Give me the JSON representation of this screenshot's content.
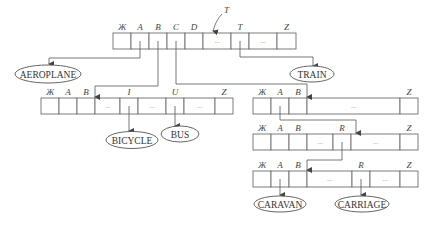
{
  "diagram": {
    "pointer_label": "T",
    "nodes": [
      {
        "id": "root",
        "cells": [
          "Ж",
          "A",
          "B",
          "C",
          "D",
          "...",
          "T",
          "...",
          "Z"
        ]
      },
      {
        "id": "node-b",
        "cells": [
          "Ж",
          "A",
          "B",
          "...",
          "I",
          "...",
          "U",
          "...",
          "Z"
        ]
      },
      {
        "id": "node-c",
        "cells": [
          "Ж",
          "A",
          "B",
          "...",
          "Z"
        ]
      },
      {
        "id": "node-ca",
        "cells": [
          "Ж",
          "A",
          "B",
          "...",
          "R",
          "...",
          "Z"
        ]
      },
      {
        "id": "node-car",
        "cells": [
          "Ж",
          "A",
          "B",
          "...",
          "R",
          "...",
          "Z"
        ]
      }
    ],
    "words": {
      "aeroplane": "AEROPLANE",
      "train": "TRAIN",
      "bicycle": "BICYCLE",
      "bus": "BUS",
      "caravan": "CARAVAN",
      "carriage": "CARRIAGE"
    },
    "edges": [
      {
        "from": "root.A",
        "to": "AEROPLANE"
      },
      {
        "from": "root.B",
        "to": "node-b"
      },
      {
        "from": "root.C",
        "to": "node-c"
      },
      {
        "from": "root.T",
        "to": "TRAIN"
      },
      {
        "from": "node-b.I",
        "to": "BICYCLE"
      },
      {
        "from": "node-b.U",
        "to": "BUS"
      },
      {
        "from": "node-c.A",
        "to": "node-ca"
      },
      {
        "from": "node-ca.R",
        "to": "node-car"
      },
      {
        "from": "node-car.A",
        "to": "CARAVAN"
      },
      {
        "from": "node-car.R",
        "to": "CARRIAGE"
      }
    ]
  }
}
